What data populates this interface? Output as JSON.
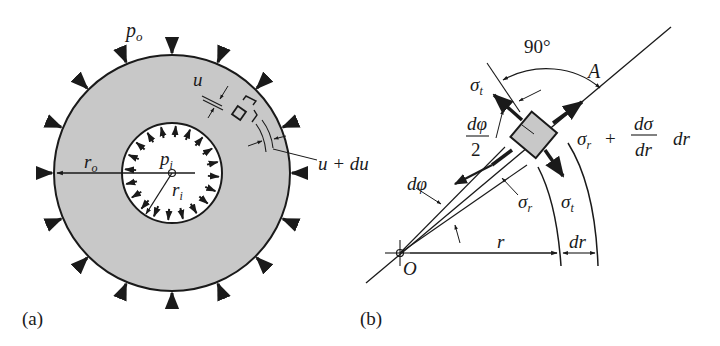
{
  "figure": {
    "panel_a": {
      "caption": "(a)",
      "labels": {
        "outer_pressure": "p",
        "outer_pressure_sub": "o",
        "inner_pressure": "p",
        "inner_pressure_sub": "i",
        "outer_radius": "r",
        "outer_radius_sub": "o",
        "inner_radius": "r",
        "inner_radius_sub": "i",
        "displacement": "u",
        "displacement_plus": "u + du"
      },
      "colors": {
        "ring_fill": "#c8c8c8",
        "stroke": "#1a1a1a",
        "bore_fill": "#ffffff"
      }
    },
    "panel_b": {
      "caption": "(b)",
      "labels": {
        "angle": "90°",
        "point_a": "A",
        "sigma_t_top": "σ",
        "sigma_t_top_sub": "t",
        "half_dphi_num": "dφ",
        "half_dphi_den": "2",
        "sigma_r_plus": "σ",
        "sigma_r_plus_sub": "r",
        "plus": "+",
        "dsigma": "dσ",
        "dr_den": "dr",
        "dr_mult": "dr",
        "dphi": "dφ",
        "sigma_r": "σ",
        "sigma_r_sub": "r",
        "sigma_t": "σ",
        "sigma_t_sub": "t",
        "radius": "r",
        "dr": "dr",
        "origin": "O"
      },
      "colors": {
        "element_fill": "#c8c8c8",
        "stroke": "#1a1a1a"
      }
    }
  }
}
